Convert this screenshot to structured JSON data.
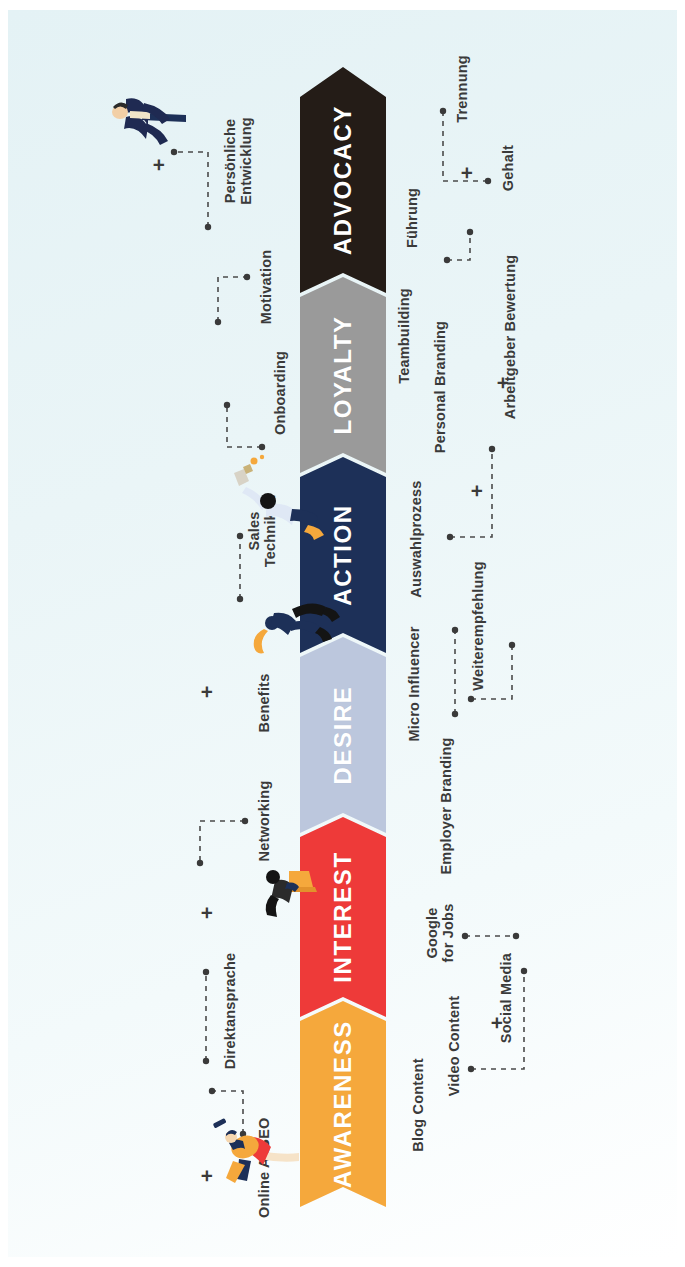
{
  "meta": {
    "background_color": "#e9f4f6"
  },
  "funnel": {
    "orientation": "vertical-rotated",
    "stages": [
      {
        "id": "awareness",
        "label": "AWARENESS",
        "color": "#f5a83c"
      },
      {
        "id": "interest",
        "label": "INTEREST",
        "color": "#ee3a39"
      },
      {
        "id": "desire",
        "label": "DESIRE",
        "color": "#bcc7dd"
      },
      {
        "id": "action",
        "label": "ACTION",
        "color": "#1d3058"
      },
      {
        "id": "loyalty",
        "label": "LOYALTY",
        "color": "#9a9a9a"
      },
      {
        "id": "advocacy",
        "label": "ADVOCACY",
        "color": "#241c17"
      }
    ]
  },
  "touchpoints": {
    "top_row": [
      {
        "stage": "awareness",
        "label": "Online Ads"
      },
      {
        "stage": "awareness",
        "label": "SEO"
      },
      {
        "stage": "awareness",
        "label": "Direktansprache"
      },
      {
        "stage": "interest",
        "label": "Networking"
      },
      {
        "stage": "desire",
        "label": "Benefits"
      },
      {
        "stage": "action",
        "label": "Sales\nTechniken"
      },
      {
        "stage": "loyalty",
        "label": "Onboarding"
      },
      {
        "stage": "loyalty",
        "label": "Motivation"
      },
      {
        "stage": "advocacy",
        "label": "Persönliche\nEntwicklung"
      }
    ],
    "bottom_row": [
      {
        "stage": "awareness",
        "label": "Blog Content"
      },
      {
        "stage": "awareness",
        "label": "Video Content"
      },
      {
        "stage": "awareness",
        "label": "Social Media"
      },
      {
        "stage": "interest",
        "label": "Google\nfor Jobs"
      },
      {
        "stage": "interest",
        "label": "Employer Branding"
      },
      {
        "stage": "desire",
        "label": "Micro Influencer"
      },
      {
        "stage": "desire",
        "label": "Weiterempfehlung"
      },
      {
        "stage": "action",
        "label": "Auswahlprozess"
      },
      {
        "stage": "action",
        "label": "Personal Branding"
      },
      {
        "stage": "action",
        "label": "Arbeitgeber Bewertung"
      },
      {
        "stage": "loyalty",
        "label": "Teambuilding"
      },
      {
        "stage": "loyalty",
        "label": "Führung"
      },
      {
        "stage": "advocacy",
        "label": "Gehalt"
      },
      {
        "stage": "advocacy",
        "label": "Trennung"
      }
    ],
    "separators": [
      {
        "id": "plus-1",
        "label": "+"
      },
      {
        "id": "plus-2",
        "label": "+"
      },
      {
        "id": "plus-3",
        "label": "+"
      },
      {
        "id": "plus-4",
        "label": "+"
      },
      {
        "id": "plus-5",
        "label": "+"
      },
      {
        "id": "plus-6",
        "label": "+"
      },
      {
        "id": "plus-7",
        "label": "+"
      },
      {
        "id": "plus-8",
        "label": "+"
      }
    ]
  },
  "illustrations": [
    {
      "id": "person-awareness",
      "name": "person-walking-orange"
    },
    {
      "id": "person-interest",
      "name": "person-with-laptop"
    },
    {
      "id": "person-desire",
      "name": "person-sitting-on-arrow"
    },
    {
      "id": "person-loyalty",
      "name": "person-celebrating-champagne"
    },
    {
      "id": "person-advocacy",
      "name": "person-standing-suit"
    }
  ]
}
